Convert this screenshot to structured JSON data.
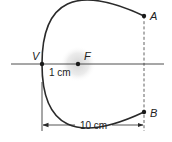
{
  "diagram": {
    "type": "parabola-geometry",
    "points": {
      "vertex": {
        "label": "V",
        "x": 42,
        "y": 64
      },
      "focus": {
        "label": "F",
        "x": 78,
        "y": 64
      },
      "a": {
        "label": "A",
        "x": 144,
        "y": 16
      },
      "b": {
        "label": "B",
        "x": 144,
        "y": 112
      }
    },
    "measurements": {
      "focal_distance": "1 cm",
      "depth": "10 cm"
    },
    "colors": {
      "stroke": "#2a2a2a",
      "focus_glow": "#d9d9d9",
      "background": "#ffffff"
    }
  }
}
